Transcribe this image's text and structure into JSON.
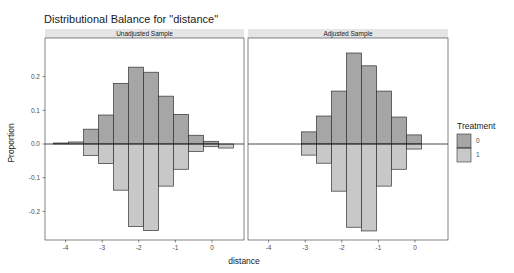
{
  "chart": {
    "title": "Distributional Balance for \"distance\"",
    "xlabel": "distance",
    "ylabel": "Proportion",
    "legend_title": "Treatment"
  },
  "colors": {
    "treat0": "#a6a6a6",
    "treat1": "#c8c8c8",
    "bar_outline": "#333333",
    "strip_bg": "#e5e5e5",
    "panel_border": "#333333"
  },
  "chart_data": {
    "type": "bar",
    "title": "Distributional Balance for \"distance\"",
    "xlabel": "distance",
    "ylabel": "Proportion",
    "ylim": [
      -0.28,
      0.28
    ],
    "xlim": [
      -4.5,
      0.9
    ],
    "x_ticks": [
      -4,
      -3,
      -2,
      -1,
      0
    ],
    "y_ticks": [
      -0.2,
      -0.1,
      0.0,
      0.1,
      0.2
    ],
    "y_tick_labels": [
      "-0.2",
      "-0.1",
      "0.0",
      "0.1",
      "0.2"
    ],
    "grid": false,
    "legend": {
      "title": "Treatment",
      "position": "right",
      "entries": [
        "0",
        "1"
      ]
    },
    "mirrored": "Treatment 0 plotted above zero, Treatment 1 plotted below zero (as negative proportions)",
    "bin_width": 0.41,
    "panels": [
      {
        "name": "Unadjusted Sample",
        "bin_left_edges": [
          -4.33,
          -3.92,
          -3.51,
          -3.1,
          -2.69,
          -2.28,
          -1.87,
          -1.46,
          -1.05,
          -0.64,
          -0.23,
          0.18
        ],
        "series": [
          {
            "name": "0",
            "values": [
              0.003,
              0.006,
              0.044,
              0.086,
              0.18,
              0.228,
              0.213,
              0.142,
              0.088,
              0.026,
              0.008,
              0.0
            ]
          },
          {
            "name": "1",
            "values": [
              0.0,
              0.0,
              -0.034,
              -0.058,
              -0.137,
              -0.245,
              -0.257,
              -0.125,
              -0.075,
              -0.022,
              -0.008,
              -0.012
            ]
          }
        ]
      },
      {
        "name": "Adjusted Sample",
        "bin_left_edges": [
          -3.1,
          -2.69,
          -2.28,
          -1.87,
          -1.46,
          -1.05,
          -0.64,
          -0.23
        ],
        "series": [
          {
            "name": "0",
            "values": [
              0.036,
              0.083,
              0.157,
              0.27,
              0.232,
              0.157,
              0.08,
              0.027
            ]
          },
          {
            "name": "1",
            "values": [
              -0.033,
              -0.057,
              -0.14,
              -0.247,
              -0.258,
              -0.125,
              -0.075,
              -0.015
            ]
          }
        ]
      }
    ]
  }
}
